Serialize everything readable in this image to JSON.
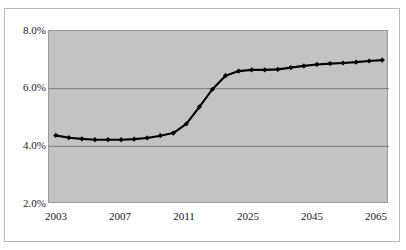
{
  "chart_data": {
    "type": "line",
    "title": "",
    "xlabel": "",
    "ylabel": "",
    "ylim": [
      2.0,
      8.0
    ],
    "yticks": [
      2.0,
      4.0,
      6.0,
      8.0
    ],
    "ytick_labels": [
      "2.0%",
      "4.0%",
      "6.0%",
      "8.0%"
    ],
    "xtick_labels": [
      "2003",
      "2007",
      "2011",
      "2025",
      "2045",
      "2065"
    ],
    "xtick_values": [
      2003,
      2007,
      2011,
      2025,
      2045,
      2065
    ],
    "grid": true,
    "legend": "none",
    "marker": "diamond",
    "line_color": "#000000",
    "plot_background": "#c3c3c3",
    "gridline_color": "#7d7d7d",
    "categories": [
      2003,
      2005,
      2007,
      2009,
      2011,
      2013,
      2015,
      2017,
      2019,
      2021,
      2023,
      2025,
      2030,
      2035,
      2040,
      2045,
      2050,
      2055,
      2060,
      2065,
      2070,
      2075,
      2080,
      2085,
      2090,
      2095
    ],
    "values": [
      4.38,
      4.3,
      4.26,
      4.23,
      4.23,
      4.23,
      4.25,
      4.29,
      4.37,
      4.46,
      4.78,
      5.37,
      5.98,
      6.45,
      6.61,
      6.65,
      6.65,
      6.67,
      6.73,
      6.79,
      6.84,
      6.87,
      6.89,
      6.92,
      6.96,
      6.99
    ],
    "series": [
      {
        "name": "cost rate",
        "values": [
          4.38,
          4.3,
          4.26,
          4.23,
          4.23,
          4.23,
          4.25,
          4.29,
          4.37,
          4.46,
          4.78,
          5.37,
          5.98,
          6.45,
          6.61,
          6.65,
          6.65,
          6.67,
          6.73,
          6.79,
          6.84,
          6.87,
          6.89,
          6.92,
          6.96,
          6.99
        ]
      }
    ]
  },
  "axes": {
    "y_labels": [
      "8.0%",
      "6.0%",
      "4.0%",
      "2.0%"
    ],
    "x_labels": [
      "2003",
      "2007",
      "2011",
      "2025",
      "2045",
      "2065"
    ]
  }
}
